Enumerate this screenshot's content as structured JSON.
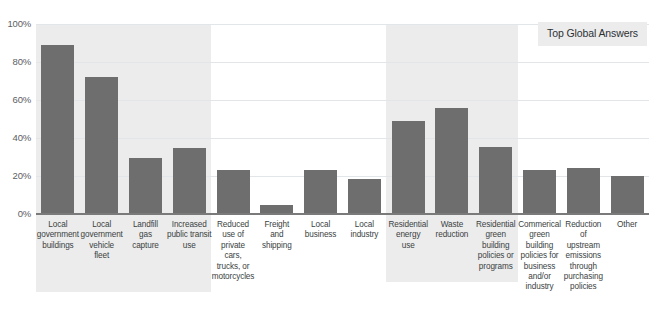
{
  "legend": {
    "label": "Top Global Answers"
  },
  "chart_data": {
    "type": "bar",
    "title": "",
    "subtitle": "",
    "xlabel": "",
    "ylabel": "",
    "ylim": [
      0,
      100
    ],
    "yticks": [
      0,
      20,
      40,
      60,
      80,
      100
    ],
    "ytick_labels": [
      "0%",
      "20%",
      "40%",
      "60%",
      "80%",
      "100%"
    ],
    "grid": true,
    "legend_position": "top-right",
    "legend_entries": [
      "Top Global Answers"
    ],
    "value_unit": "%",
    "categories": [
      "Local government buildings",
      "Local government vehicle fleet",
      "Landfill gas capture",
      "Increased public transit use",
      "Reduced use of private cars, trucks, or motorcycles",
      "Freight and shipping",
      "Local business",
      "Local industry",
      "Residential energy use",
      "Waste reduction",
      "Residential green building policies or programs",
      "Commerical green building policies for business and/or industry",
      "Reduction of upstream emissions through purchasing policies",
      "Other"
    ],
    "category_lines": [
      [
        "Local",
        "government",
        "buildings"
      ],
      [
        "Local",
        "government",
        "vehicle",
        "fleet"
      ],
      [
        "Landfill",
        "gas",
        "capture"
      ],
      [
        "Increased",
        "public transit",
        "use"
      ],
      [
        "Reduced",
        "use of",
        "private",
        "cars,",
        "trucks, or",
        "motorcycles"
      ],
      [
        "Freight",
        "and",
        "shipping"
      ],
      [
        "Local",
        "business"
      ],
      [
        "Local",
        "industry"
      ],
      [
        "Residential",
        "energy",
        "use"
      ],
      [
        "Waste",
        "reduction"
      ],
      [
        "Residential",
        "green",
        "building",
        "policies or",
        "programs"
      ],
      [
        "Commerical",
        "green",
        "building",
        "policies for",
        "business",
        "and/or",
        "industry"
      ],
      [
        "Reduction",
        "of",
        "upstream",
        "emissions",
        "through",
        "purchasing",
        "policies"
      ],
      [
        "Other"
      ]
    ],
    "values": [
      89,
      72,
      29.5,
      35,
      23,
      5,
      23,
      18.5,
      49,
      56,
      35.5,
      23,
      24,
      20
    ],
    "series": [
      {
        "name": "Top Global Answers",
        "values": [
          89,
          72,
          29.5,
          35,
          23,
          5,
          23,
          18.5,
          49,
          56,
          35.5,
          23,
          24,
          20
        ]
      }
    ],
    "shaded_bands": [
      {
        "start_index": 0,
        "end_index": 3
      },
      {
        "start_index": 8,
        "end_index": 10
      }
    ]
  },
  "colors": {
    "bar": "#6e6e6e",
    "band": "#ececec",
    "gridline": "#e3e6e8",
    "axis": "#7a7a7a",
    "tick_text": "#5d6063",
    "label_text": "#3b3f42",
    "background": "#ffffff"
  }
}
